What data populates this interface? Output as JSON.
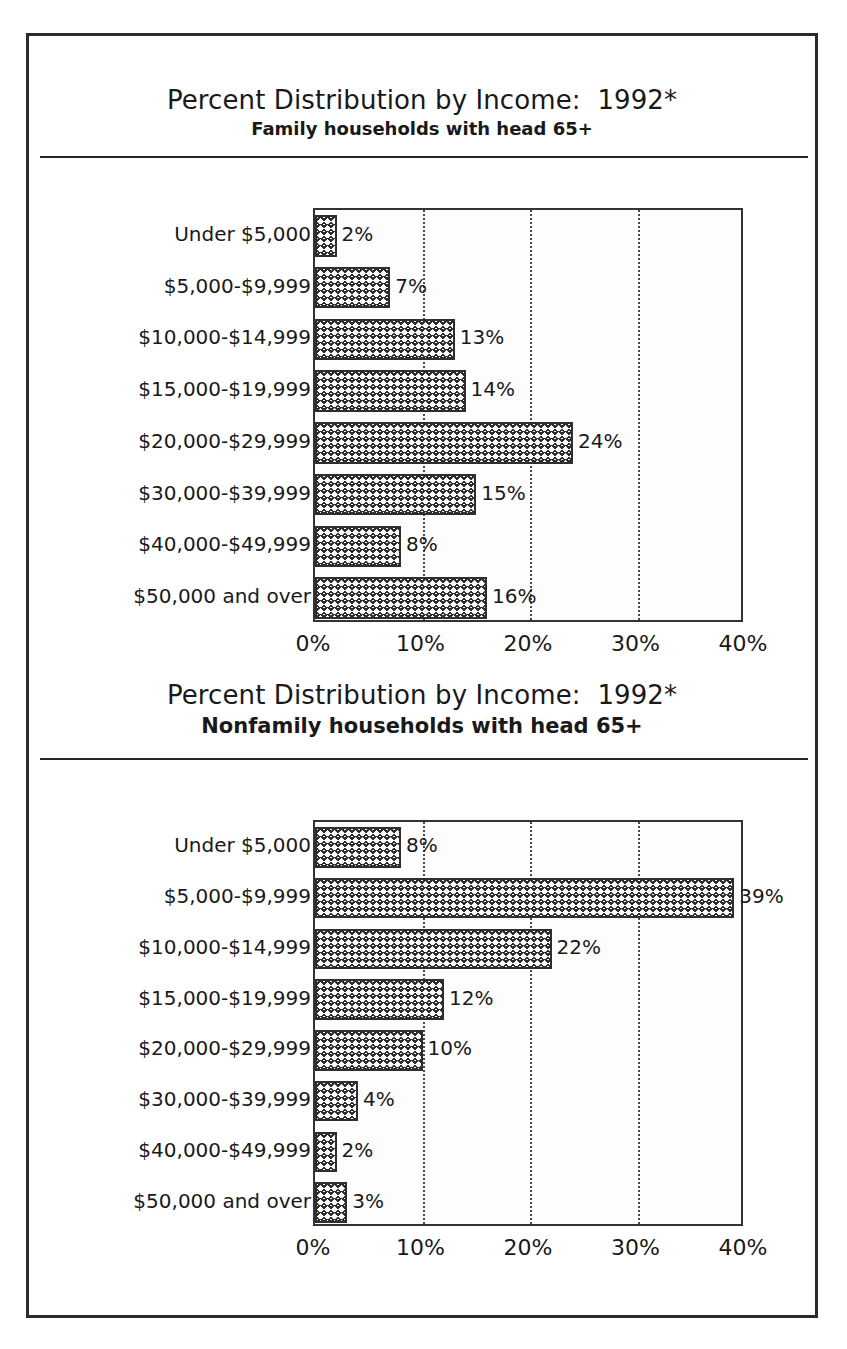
{
  "page": {
    "border_color": "#2b2b2b"
  },
  "charts": [
    {
      "title": "Percent Distribution by Income:  1992*",
      "subtitle": "Family households with head 65+",
      "axis": {
        "ticks": [
          "0%",
          "10%",
          "20%",
          "30%",
          "40%"
        ],
        "tick_values": [
          0,
          10,
          20,
          30,
          40
        ],
        "min": 0,
        "max": 40
      },
      "bars": [
        {
          "label": "Under $5,000",
          "value": 2,
          "value_label": "2%"
        },
        {
          "label": "$5,000-$9,999",
          "value": 7,
          "value_label": "7%"
        },
        {
          "label": "$10,000-$14,999",
          "value": 13,
          "value_label": "13%"
        },
        {
          "label": "$15,000-$19,999",
          "value": 14,
          "value_label": "14%"
        },
        {
          "label": "$20,000-$29,999",
          "value": 24,
          "value_label": "24%"
        },
        {
          "label": "$30,000-$39,999",
          "value": 15,
          "value_label": "15%"
        },
        {
          "label": "$40,000-$49,999",
          "value": 8,
          "value_label": "8%"
        },
        {
          "label": "$50,000 and over",
          "value": 16,
          "value_label": "16%"
        }
      ]
    },
    {
      "title": "Percent Distribution by Income:  1992*",
      "subtitle": "Nonfamily households with head 65+",
      "axis": {
        "ticks": [
          "0%",
          "10%",
          "20%",
          "30%",
          "40%"
        ],
        "tick_values": [
          0,
          10,
          20,
          30,
          40
        ],
        "min": 0,
        "max": 40
      },
      "bars": [
        {
          "label": "Under $5,000",
          "value": 8,
          "value_label": "8%"
        },
        {
          "label": "$5,000-$9,999",
          "value": 39,
          "value_label": "39%"
        },
        {
          "label": "$10,000-$14,999",
          "value": 22,
          "value_label": "22%"
        },
        {
          "label": "$15,000-$19,999",
          "value": 12,
          "value_label": "12%"
        },
        {
          "label": "$20,000-$29,999",
          "value": 10,
          "value_label": "10%"
        },
        {
          "label": "$30,000-$39,999",
          "value": 4,
          "value_label": "4%"
        },
        {
          "label": "$40,000-$49,999",
          "value": 2,
          "value_label": "2%"
        },
        {
          "label": "$50,000 and over",
          "value": 3,
          "value_label": "3%"
        }
      ]
    }
  ],
  "chart_data": [
    {
      "type": "bar",
      "orientation": "horizontal",
      "title": "Percent Distribution by Income:  1992*",
      "subtitle": "Family households with head 65+",
      "categories": [
        "Under $5,000",
        "$5,000-$9,999",
        "$10,000-$14,999",
        "$15,000-$19,999",
        "$20,000-$29,999",
        "$30,000-$39,999",
        "$40,000-$49,999",
        "$50,000 and over"
      ],
      "values": [
        2,
        7,
        13,
        14,
        24,
        15,
        8,
        16
      ],
      "data_labels": [
        "2%",
        "7%",
        "13%",
        "14%",
        "24%",
        "15%",
        "8%",
        "16%"
      ],
      "xlabel": "",
      "ylabel": "",
      "xlim": [
        0,
        40
      ],
      "xticks": [
        0,
        10,
        20,
        30,
        40
      ],
      "xticklabels": [
        "0%",
        "10%",
        "20%",
        "30%",
        "40%"
      ],
      "grid": "vertical-dotted",
      "legend": "none",
      "bar_fill": "crosshatch"
    },
    {
      "type": "bar",
      "orientation": "horizontal",
      "title": "Percent Distribution by Income:  1992*",
      "subtitle": "Nonfamily households with head 65+",
      "categories": [
        "Under $5,000",
        "$5,000-$9,999",
        "$10,000-$14,999",
        "$15,000-$19,999",
        "$20,000-$29,999",
        "$30,000-$39,999",
        "$40,000-$49,999",
        "$50,000 and over"
      ],
      "values": [
        8,
        39,
        22,
        12,
        10,
        4,
        2,
        3
      ],
      "data_labels": [
        "8%",
        "39%",
        "22%",
        "12%",
        "10%",
        "4%",
        "2%",
        "3%"
      ],
      "xlabel": "",
      "ylabel": "",
      "xlim": [
        0,
        40
      ],
      "xticks": [
        0,
        10,
        20,
        30,
        40
      ],
      "xticklabels": [
        "0%",
        "10%",
        "20%",
        "30%",
        "40%"
      ],
      "grid": "vertical-dotted",
      "legend": "none",
      "bar_fill": "crosshatch"
    }
  ]
}
